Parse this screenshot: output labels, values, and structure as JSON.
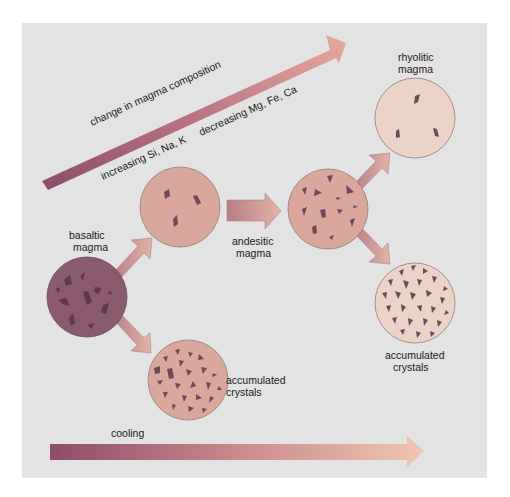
{
  "diagram": {
    "title_arrow": {
      "label": "change in magma composition",
      "increasing": "increasing Si, Na, K",
      "decreasing": "decreasing Mg, Fe, Ca"
    },
    "magmas": {
      "basaltic": {
        "line1": "basaltic",
        "line2": "magma"
      },
      "andesitic": {
        "line1": "andesitic",
        "line2": "magma"
      },
      "rhyolitic": {
        "line1": "rhyolitic",
        "line2": "magma"
      }
    },
    "accumulated_left": {
      "line1": "accumulated",
      "line2": "crystals"
    },
    "accumulated_right": {
      "line1": "accumulated",
      "line2": "crystals"
    },
    "cooling": {
      "label": "cooling"
    },
    "colors": {
      "panel": "#e3e3e3",
      "basaltic_fill": "#8a5a6e",
      "andesitic_fill": "#d9a79b",
      "rhyolitic_fill": "#ecd3c8",
      "crystal": "#6b4a5a",
      "arrow_dark": "#8c4d6a",
      "arrow_light": "#e8b8a0"
    }
  }
}
